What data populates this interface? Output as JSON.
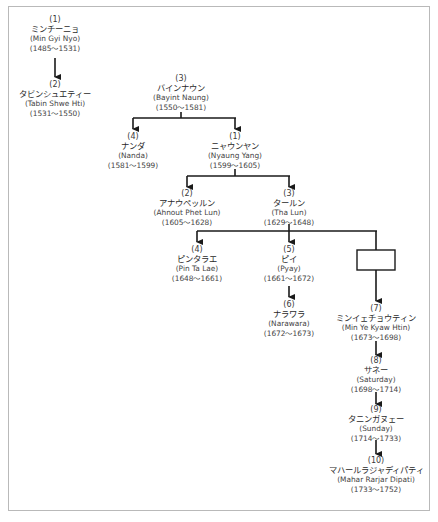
{
  "diagram": {
    "type": "genealogy-tree",
    "nodes": [
      {
        "id": "min-gyi-nyo",
        "num": "(1)",
        "jp": "ミンチーニョ",
        "en": "(Min Gyi Nyo)",
        "years": "(1485～1531)"
      },
      {
        "id": "tabin-shwe-hti",
        "num": "(2)",
        "jp": "タビンシュエティー",
        "en": "(Tabin Shwe Hti)",
        "years": "(1531～1550)"
      },
      {
        "id": "bayint-naung",
        "num": "(3)",
        "jp": "バインナウン",
        "en": "(Bayint Naung)",
        "years": "(1550～1581)"
      },
      {
        "id": "nanda",
        "num": "(4)",
        "jp": "ナンダ",
        "en": "(Nanda)",
        "years": "(1581～1599)"
      },
      {
        "id": "nyaung-yang",
        "num": "(1)",
        "jp": "ニャウンヤン",
        "en": "(Nyaung Yang)",
        "years": "(1599～1605)"
      },
      {
        "id": "ahnout-phet-lun",
        "num": "(2)",
        "jp": "アナウペッルン",
        "en": "(Ahnout Phet Lun)",
        "years": "(1605～1628)"
      },
      {
        "id": "tha-lun",
        "num": "(3)",
        "jp": "タールン",
        "en": "(Tha Lun)",
        "years": "(1629～1648)"
      },
      {
        "id": "pin-ta-lae",
        "num": "(4)",
        "jp": "ピンタラエ",
        "en": "(Pin Ta Lae)",
        "years": "(1648～1661)"
      },
      {
        "id": "pyay",
        "num": "(5)",
        "jp": "ピイ",
        "en": "(Pyay)",
        "years": "(1661～1672)"
      },
      {
        "id": "narawara",
        "num": "(6)",
        "jp": "ナラワラ",
        "en": "(Narawara)",
        "years": "(1672～1673)"
      },
      {
        "id": "min-ye-kyaw-htin",
        "num": "(7)",
        "jp": "ミンイェチョウティン",
        "en": "(Min Ye Kyaw Htin)",
        "years": "(1673～1698)"
      },
      {
        "id": "saturday",
        "num": "(8)",
        "jp": "サネー",
        "en": "(Saturday)",
        "years": "(1698～1714)"
      },
      {
        "id": "sunday",
        "num": "(9)",
        "jp": "タニンガヌェー",
        "en": "(Sunday)",
        "years": "(1714～1733)"
      },
      {
        "id": "mahar-rarjar-dipati",
        "num": "(10)",
        "jp": "マハールラジャディパティ",
        "en": "(Mahar Rarjar Dipati)",
        "years": "(1733～1752)"
      }
    ],
    "edges": [
      {
        "from": "min-gyi-nyo",
        "to": "tabin-shwe-hti"
      },
      {
        "from": "bayint-naung",
        "to": "nanda"
      },
      {
        "from": "bayint-naung",
        "to": "nyaung-yang"
      },
      {
        "from": "nyaung-yang",
        "to": "ahnout-phet-lun"
      },
      {
        "from": "nyaung-yang",
        "to": "tha-lun"
      },
      {
        "from": "tha-lun",
        "to": "pin-ta-lae"
      },
      {
        "from": "tha-lun",
        "to": "pyay"
      },
      {
        "from": "tha-lun",
        "to": "unnamed-box"
      },
      {
        "from": "unnamed-box",
        "to": "min-ye-kyaw-htin"
      },
      {
        "from": "pyay",
        "to": "narawara"
      },
      {
        "from": "min-ye-kyaw-htin",
        "to": "saturday"
      },
      {
        "from": "saturday",
        "to": "sunday"
      },
      {
        "from": "sunday",
        "to": "mahar-rarjar-dipati"
      }
    ],
    "empty_box": {
      "id": "unnamed-box",
      "label": ""
    },
    "colors": {
      "line": "#1a1a1a",
      "frame": "#b9b9b9",
      "text": "#333333"
    }
  }
}
